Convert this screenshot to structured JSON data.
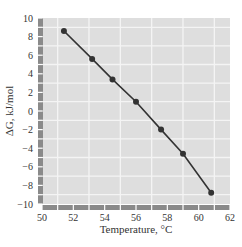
{
  "chart_data": {
    "type": "line",
    "title": "",
    "xlabel": "Temperature, °C",
    "ylabel": "ΔG, kJ/mol",
    "xlim": [
      50,
      62
    ],
    "ylim": [
      -10,
      10
    ],
    "x_ticks": [
      50,
      52,
      54,
      56,
      58,
      60,
      62
    ],
    "y_ticks": [
      10,
      8,
      6,
      4,
      2,
      0,
      -2,
      -4,
      -6,
      -8,
      -10
    ],
    "x_tick_labels": [
      "50",
      "52",
      "54",
      "56",
      "58",
      "60",
      "62"
    ],
    "y_tick_labels": [
      "10",
      "8",
      "6",
      "4",
      "2",
      "0",
      "−2",
      "−4",
      "−6",
      "−8",
      "−10"
    ],
    "grid": true,
    "legend": null,
    "series": [
      {
        "name": "ΔG vs Temperature",
        "x": [
          51.4,
          53.2,
          54.5,
          56.0,
          57.6,
          59.0,
          60.8
        ],
        "y": [
          8.6,
          5.6,
          3.4,
          1.0,
          -2.0,
          -4.6,
          -8.8
        ],
        "marker": "circle",
        "color": "#333333"
      }
    ],
    "colors": {
      "plot_background": "#dedede",
      "grid": "#f4f4f4",
      "axis_bar": "#8a8a8a",
      "line": "#333333"
    }
  }
}
